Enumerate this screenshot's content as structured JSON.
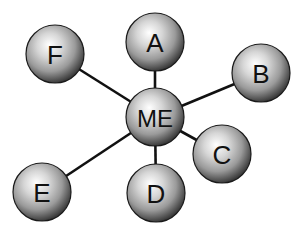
{
  "diagram": {
    "type": "hub-and-spoke network",
    "center": {
      "id": "ME",
      "label": "ME",
      "x": 155,
      "y": 117,
      "r": 29
    },
    "nodes": [
      {
        "id": "A",
        "label": "A",
        "x": 155,
        "y": 42,
        "r": 29
      },
      {
        "id": "B",
        "label": "B",
        "x": 261,
        "y": 73,
        "r": 29
      },
      {
        "id": "C",
        "label": "C",
        "x": 222,
        "y": 154,
        "r": 29
      },
      {
        "id": "D",
        "label": "D",
        "x": 156,
        "y": 193,
        "r": 29
      },
      {
        "id": "E",
        "label": "E",
        "x": 42,
        "y": 192,
        "r": 29
      },
      {
        "id": "F",
        "label": "F",
        "x": 55,
        "y": 54,
        "r": 29
      }
    ],
    "edges": [
      {
        "from": "ME",
        "to": "A"
      },
      {
        "from": "ME",
        "to": "B"
      },
      {
        "from": "ME",
        "to": "C"
      },
      {
        "from": "ME",
        "to": "D"
      },
      {
        "from": "ME",
        "to": "E"
      },
      {
        "from": "ME",
        "to": "F"
      }
    ],
    "colors": {
      "edge": "#111111",
      "sphere_highlight": "#ffffff",
      "sphere_mid": "#b8b8b8",
      "sphere_shadow": "#3a3a3a",
      "text": "#111111"
    }
  }
}
